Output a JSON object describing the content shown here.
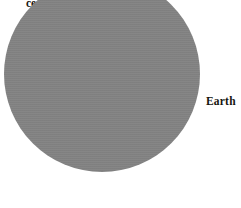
{
  "figure": {
    "name": "earth-diagram",
    "background_color": "#ffffff"
  },
  "earth": {
    "label": "Earth",
    "fill_color": "#828282",
    "shape": "circle"
  },
  "caption_fragment": {
    "top_sliver": "(…)",
    "line_1": "ce-",
    "line_2": "re"
  }
}
